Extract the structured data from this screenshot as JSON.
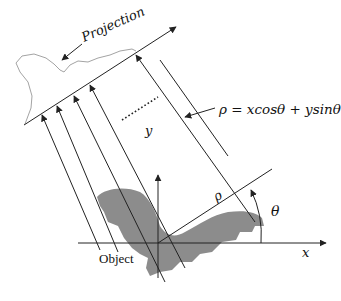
{
  "diagram": {
    "labels": {
      "projection": "Projection",
      "equation": "ρ = xcosθ + ysinθ",
      "object": "Object",
      "x_axis": "x",
      "y_axis": "y",
      "rho": "ρ",
      "theta": "θ"
    },
    "colors": {
      "line": "#222222",
      "object_fill": "#8c8c8c",
      "projection_curve": "#999999",
      "background": "#ffffff"
    },
    "ray_count_visible": 5,
    "ellipsis": "dotted line indicating more rays"
  }
}
